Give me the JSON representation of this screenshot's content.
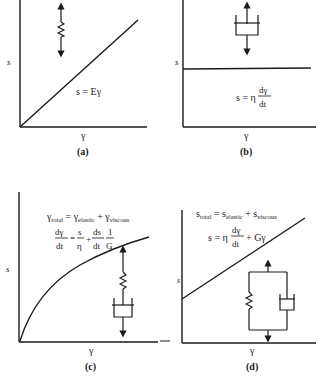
{
  "panels": [
    {
      "id": "a",
      "caption": "(a)",
      "y_axis_label": "s",
      "x_axis_label": "γ",
      "model": "spring (elastic)",
      "equation": "s = Eγ",
      "curve": "linear through origin"
    },
    {
      "id": "b",
      "caption": "(b)",
      "y_axis_label": "s",
      "x_axis_label": "γ",
      "model": "dashpot (viscous)",
      "equation": {
        "lhs": "s = η",
        "num": "dγ",
        "den": "dt"
      },
      "curve": "constant horizontal line"
    },
    {
      "id": "c",
      "caption": "(c)",
      "y_axis_label": "s",
      "x_axis_label": "γ",
      "model": "spring and dashpot in series (Maxwell)",
      "equation_1": {
        "gamma": "γ",
        "sub_total": "total",
        "eq": " = ",
        "sub_elastic": "elastic",
        "plus": " + ",
        "sub_viscous": "viscous"
      },
      "equation_2": {
        "num1": "dγ",
        "den1": "dt",
        "eq": "=",
        "num2": "s",
        "den2": "η",
        "plus": "+",
        "num3": "ds",
        "den3": "dt",
        "num4": "1",
        "den4": "G"
      },
      "curve": "concave rising curve"
    },
    {
      "id": "d",
      "caption": "(d)",
      "y_axis_label": "s",
      "x_axis_label": "γ",
      "model": "spring and dashpot in parallel (Kelvin-Voigt)",
      "equation_1": {
        "s": "s",
        "sub_total": "total",
        "eq": " = ",
        "sub_elastic": "elastic",
        "plus": " + ",
        "sub_viscous": "viscous"
      },
      "equation_2": {
        "lhs": "s = η",
        "num": "dγ",
        "den": "dt",
        "rhs": "+ Gγ"
      },
      "curve": "linear with positive intercept"
    }
  ]
}
